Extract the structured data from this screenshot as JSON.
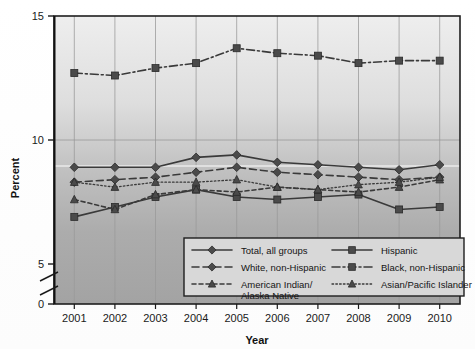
{
  "chart_data": {
    "type": "line",
    "title": "",
    "xlabel": "Year",
    "ylabel": "Percent",
    "categories": [
      "2001",
      "2002",
      "2003",
      "2004",
      "2005",
      "2006",
      "2007",
      "2008",
      "2009",
      "2010"
    ],
    "x": [
      2001,
      2002,
      2003,
      2004,
      2005,
      2006,
      2007,
      2008,
      2009,
      2010
    ],
    "ylim": [
      0,
      15
    ],
    "yticks": [
      0,
      5,
      10,
      15
    ],
    "ytick_labels": [
      "0",
      "5",
      "10",
      "15"
    ],
    "axis_break": true,
    "axis_break_between": [
      0,
      5
    ],
    "grid": "both",
    "legend_position": "inside-bottom-center",
    "series": [
      {
        "name": "Total, all groups",
        "marker": "diamond",
        "line_style": "solid",
        "values": [
          8.9,
          8.9,
          8.9,
          9.3,
          9.4,
          9.1,
          9.0,
          8.9,
          8.8,
          9.0
        ]
      },
      {
        "name": "Hispanic",
        "marker": "square",
        "line_style": "solid",
        "values": [
          6.9,
          7.3,
          7.7,
          8.0,
          7.7,
          7.6,
          7.7,
          7.8,
          7.2,
          7.3
        ]
      },
      {
        "name": "White, non-Hispanic",
        "marker": "diamond",
        "line_style": "dashed",
        "values": [
          8.3,
          8.4,
          8.5,
          8.7,
          8.9,
          8.7,
          8.6,
          8.5,
          8.4,
          8.5
        ]
      },
      {
        "name": "Black, non-Hispanic",
        "marker": "square",
        "line_style": "dash-dot",
        "values": [
          12.7,
          12.6,
          12.9,
          13.1,
          13.7,
          13.5,
          13.4,
          13.1,
          13.2,
          13.2
        ]
      },
      {
        "name": "American Indian/Alaska Native",
        "marker": "triangle",
        "line_style": "dashed-short",
        "values": [
          7.6,
          7.2,
          7.8,
          8.0,
          7.9,
          8.1,
          8.0,
          7.9,
          8.1,
          8.4
        ]
      },
      {
        "name": "Asian/Pacific Islander",
        "marker": "triangle",
        "line_style": "dotted",
        "values": [
          8.3,
          8.1,
          8.3,
          8.3,
          8.4,
          8.1,
          8.0,
          8.2,
          8.3,
          8.5
        ]
      }
    ]
  },
  "axes": {
    "y_title": "Percent",
    "x_title": "Year",
    "y_ticks": [
      "15",
      "10",
      "5",
      "0"
    ],
    "x_ticks": [
      "2001",
      "2002",
      "2003",
      "2004",
      "2005",
      "2006",
      "2007",
      "2008",
      "2009",
      "2010"
    ]
  },
  "legend": {
    "entries": [
      {
        "label": "Total, all groups",
        "marker": "diamond",
        "style": "solid"
      },
      {
        "label": "Hispanic",
        "marker": "square",
        "style": "solid"
      },
      {
        "label": "White, non-Hispanic",
        "marker": "diamond",
        "style": "dashed"
      },
      {
        "label": "Black, non-Hispanic",
        "marker": "square",
        "style": "dash-dot"
      },
      {
        "label": "American Indian/",
        "label2": "Alaska Native",
        "marker": "triangle",
        "style": "dashed-short"
      },
      {
        "label": "Asian/Pacific Islander",
        "marker": "triangle",
        "style": "dotted"
      }
    ]
  },
  "colors": {
    "line": "#3a3a3a",
    "marker": "#4a4a4a",
    "axis": "#1e1e1e",
    "grid": "#9a9a9a",
    "plot_bg_top": "#e8e8e8",
    "plot_bg_bottom": "#a8a8a8",
    "legend_bg": "#d6d6d6",
    "page_bg": "#ffffff"
  }
}
